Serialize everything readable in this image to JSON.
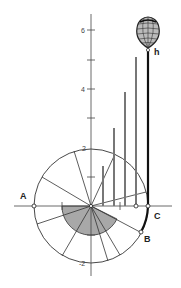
{
  "diagram": {
    "title": "",
    "points": {
      "A": "A",
      "B": "B",
      "C": "C",
      "h": "h"
    },
    "axis_ticks": [
      {
        "value": 6,
        "label": "6"
      },
      {
        "value": 5,
        "label": ""
      },
      {
        "value": 4,
        "label": "4"
      },
      {
        "value": 3,
        "label": ""
      },
      {
        "value": 2,
        "label": "2"
      },
      {
        "value": -2,
        "label": "-2"
      }
    ],
    "bars": [
      {
        "x_index": 1,
        "height_units": 1.4
      },
      {
        "x_index": 2,
        "height_units": 2.7
      },
      {
        "x_index": 3,
        "height_units": 3.9
      },
      {
        "x_index": 4,
        "height_units": 5.1
      }
    ],
    "colors": {
      "line": "#333333",
      "bar": "#777777",
      "shaded_sector": "#a8a8a8",
      "thick_line": "#111111",
      "background": "#ffffff"
    }
  }
}
